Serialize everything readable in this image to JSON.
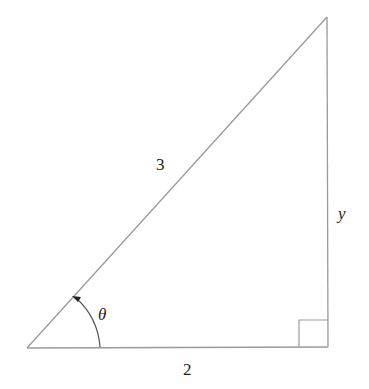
{
  "diagram": {
    "type": "right-triangle",
    "labels": {
      "hypotenuse": "3",
      "base": "2",
      "opposite": "y",
      "angle": "θ"
    },
    "colors": {
      "line": "#9a9a9a",
      "text": "#222222"
    }
  }
}
